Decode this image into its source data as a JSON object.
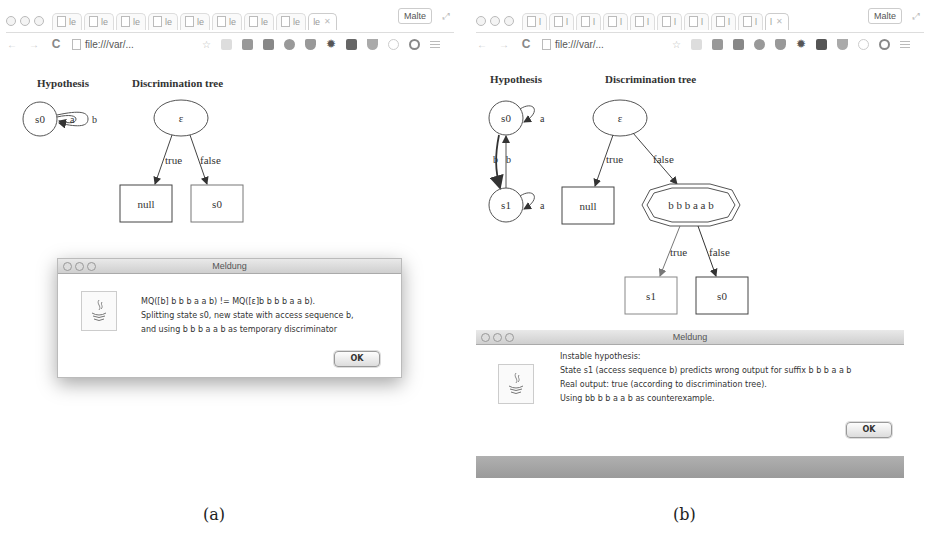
{
  "panels": [
    {
      "id": "a",
      "caption": "(a)",
      "browser": {
        "tabs": [
          "le",
          "le",
          "le",
          "le",
          "le",
          "le",
          "le",
          "le",
          "le"
        ],
        "active_tab": "le",
        "profile": "Malte",
        "url": "file:///var/...",
        "extension_icons": [
          "bookmark-star-icon",
          "save-icon",
          "drive-icon",
          "facebook-icon",
          "adblock-icon",
          "pocket-icon",
          "gear-icon",
          "klout-icon",
          "evernote-icon",
          "lightbulb-icon",
          "pinterest-icon",
          "menu-icon"
        ]
      },
      "hypothesis": {
        "title": "Hypothesis",
        "states": [
          "s0"
        ],
        "edges": [
          {
            "from": "s0",
            "to": "s0",
            "label": "a"
          },
          {
            "from": "s0",
            "to": "s0",
            "label": "b"
          }
        ]
      },
      "tree": {
        "title": "Discrimination tree",
        "root": "ε",
        "edge_true": "true",
        "edge_false": "false",
        "leaf_true": "null",
        "leaf_false": "s0"
      },
      "dialog": {
        "title": "Meldung",
        "lines": [
          "MQ([b] b b b a a b) != MQ([ε]b b b b a a b).",
          "Splitting state s0, new state with access sequence b,",
          "and using b b b a a b as temporary discriminator"
        ],
        "ok_label": "OK"
      }
    },
    {
      "id": "b",
      "caption": "(b)",
      "browser": {
        "tabs": [
          "l",
          "l",
          "l",
          "l",
          "l",
          "l",
          "l",
          "l",
          "l"
        ],
        "active_tab": "l",
        "profile": "Malte",
        "url": "file:///var/...",
        "extension_icons": [
          "bookmark-star-icon",
          "save-icon",
          "drive-icon",
          "facebook-icon",
          "adblock-icon",
          "pocket-icon",
          "gear-icon",
          "klout-icon",
          "evernote-icon",
          "lightbulb-icon",
          "pinterest-icon",
          "menu-icon"
        ]
      },
      "hypothesis": {
        "title": "Hypothesis",
        "states": [
          "s0",
          "s1"
        ],
        "edges": [
          {
            "from": "s0",
            "to": "s0",
            "label": "a"
          },
          {
            "from": "s0",
            "to": "s1",
            "label": "b"
          },
          {
            "from": "s1",
            "to": "s0",
            "label": "b"
          },
          {
            "from": "s1",
            "to": "s1",
            "label": "a"
          }
        ]
      },
      "tree": {
        "title": "Discrimination tree",
        "root": "ε",
        "edge_true": "true",
        "edge_false": "false",
        "leaf_true": "null",
        "inner_node": "b b b a a b",
        "inner_true": "true",
        "inner_false": "false",
        "inner_leaf_true": "s1",
        "inner_leaf_false": "s0"
      },
      "dialog": {
        "title": "Meldung",
        "lines": [
          "Instable hypothesis:",
          "State s1 (access sequence b) predicts wrong output for suffix b b b a a b",
          "Real output: true (according to discrimination tree).",
          "Using bb b b a a b as counterexample."
        ],
        "ok_label": "OK"
      }
    }
  ]
}
